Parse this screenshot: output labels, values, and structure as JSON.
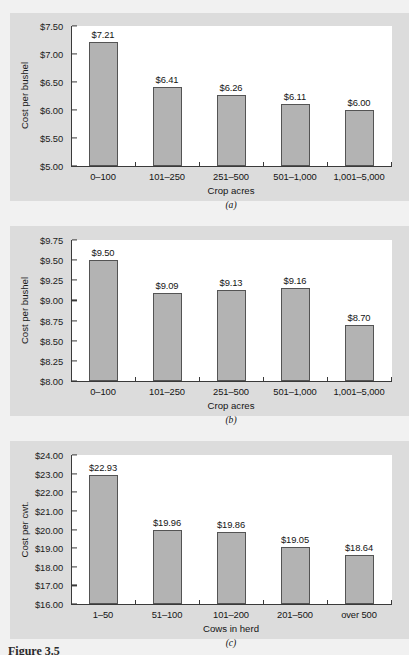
{
  "figure": {
    "caption": "Figure 3.5"
  },
  "chart_data": [
    {
      "id": "a",
      "type": "bar",
      "subcaption": "(a)",
      "title": "",
      "xlabel": "Crop acres",
      "ylabel": "Cost per bushel",
      "categories": [
        "0–100",
        "101–250",
        "251–500",
        "501–1,000",
        "1,001–5,000"
      ],
      "values": [
        7.21,
        6.41,
        6.26,
        6.11,
        6.0
      ],
      "value_labels": [
        "$7.21",
        "$6.41",
        "$6.26",
        "$6.11",
        "$6.00"
      ],
      "ylim": [
        5.0,
        7.5
      ],
      "ystep": 0.5,
      "ytick_labels": [
        "$5.00",
        "$5.50",
        "$6.00",
        "$6.50",
        "$7.00",
        "$7.50"
      ],
      "grid": false,
      "bar_color": "#b3b3b3",
      "bar_edge_color": "#545454"
    },
    {
      "id": "b",
      "type": "bar",
      "subcaption": "(b)",
      "title": "",
      "xlabel": "Crop acres",
      "ylabel": "Cost per bushel",
      "categories": [
        "0–100",
        "101–250",
        "251–500",
        "501–1,000",
        "1,001–5,000"
      ],
      "values": [
        9.5,
        9.09,
        9.13,
        9.16,
        8.7
      ],
      "value_labels": [
        "$9.50",
        "$9.09",
        "$9.13",
        "$9.16",
        "$8.70"
      ],
      "ylim": [
        8.0,
        9.75
      ],
      "ystep": 0.25,
      "ytick_labels": [
        "$8.00",
        "$8.25",
        "$8.50",
        "$8.75",
        "$9.00",
        "$9.25",
        "$9.50",
        "$9.75"
      ],
      "grid": false,
      "bar_color": "#b3b3b3",
      "bar_edge_color": "#545454"
    },
    {
      "id": "c",
      "type": "bar",
      "subcaption": "(c)",
      "title": "",
      "xlabel": "Cows in herd",
      "ylabel": "Cost per cwt.",
      "categories": [
        "1–50",
        "51–100",
        "101–200",
        "201–500",
        "over 500"
      ],
      "values": [
        22.93,
        19.96,
        19.86,
        19.05,
        18.64
      ],
      "value_labels": [
        "$22.93",
        "$19.96",
        "$19.86",
        "$19.05",
        "$18.64"
      ],
      "ylim": [
        16.0,
        24.0
      ],
      "ystep": 1.0,
      "ytick_labels": [
        "$16.00",
        "$17.00",
        "$18.00",
        "$19.00",
        "$20.00",
        "$21.00",
        "$22.00",
        "$23.00",
        "$24.00"
      ],
      "grid": false,
      "bar_color": "#b3b3b3",
      "bar_edge_color": "#545454"
    }
  ]
}
